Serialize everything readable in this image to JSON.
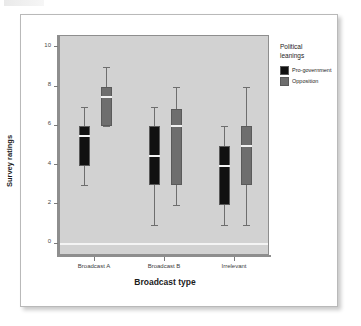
{
  "figure": {
    "background": "#ffffff",
    "plot_background": "#d2d2d2"
  },
  "legend": {
    "title_line1": "Political",
    "title_line2": "leanings",
    "items": [
      {
        "label": "Pro-government",
        "color": "#111111"
      },
      {
        "label": "Opposition",
        "color": "#6e6e6e"
      }
    ]
  },
  "chart_data": {
    "type": "box",
    "title": "",
    "xlabel": "Broadcast type",
    "ylabel": "Survey ratings",
    "categories": [
      "Broadcast A",
      "Broadcast B",
      "Irrelevant"
    ],
    "ylim": [
      -0.6,
      10.6
    ],
    "yticks": [
      0,
      2,
      4,
      6,
      8,
      10
    ],
    "ytick_labels": [
      "0",
      "2",
      "4",
      "6",
      "8",
      "10"
    ],
    "grid": false,
    "legend_position": "right",
    "series": [
      {
        "name": "Pro-government",
        "color": "#111111",
        "boxes": [
          {
            "category": "Broadcast A",
            "whisker_low": 3,
            "q1": 4,
            "median": 5.5,
            "q3": 6,
            "whisker_high": 7
          },
          {
            "category": "Broadcast B",
            "whisker_low": 1,
            "q1": 3,
            "median": 4.5,
            "q3": 6,
            "whisker_high": 7
          },
          {
            "category": "Irrelevant",
            "whisker_low": 1,
            "q1": 2,
            "median": 4,
            "q3": 5,
            "whisker_high": 6
          }
        ]
      },
      {
        "name": "Opposition",
        "color": "#6e6e6e",
        "boxes": [
          {
            "category": "Broadcast A",
            "whisker_low": 6,
            "q1": 6,
            "median": 7.5,
            "q3": 8,
            "whisker_high": 9
          },
          {
            "category": "Broadcast B",
            "whisker_low": 2,
            "q1": 3,
            "median": 6,
            "q3": 6.9,
            "whisker_high": 8
          },
          {
            "category": "Irrelevant",
            "whisker_low": 1,
            "q1": 3,
            "median": 5,
            "q3": 6,
            "whisker_high": 8
          }
        ]
      }
    ]
  }
}
